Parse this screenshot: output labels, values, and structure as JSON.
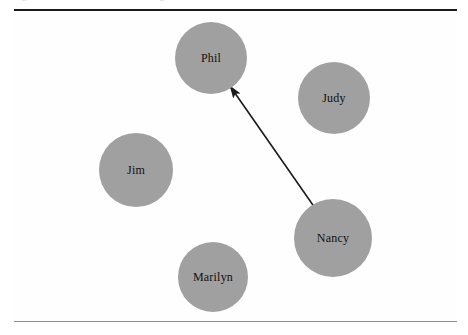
{
  "figure": {
    "type": "sociogram",
    "caption_bleed_left": "g",
    "caption_bleed_right": "g",
    "node_fill_color": "#a0a0a0",
    "node_label_color": "#111111",
    "edge_color": "#1a1a1a",
    "rule_top_color": "#1b1b1b",
    "rule_bottom_color": "#8d8d8d",
    "background_color": "#ffffff"
  },
  "chart_data": {
    "type": "scatter",
    "title": "",
    "xlabel": "",
    "ylabel": "",
    "grid": false,
    "legend": "none",
    "xlim": [
      0,
      468
    ],
    "ylim": [
      0,
      335
    ],
    "nodes": [
      {
        "id": "phil",
        "label": "Phil",
        "x": 211,
        "y": 58,
        "r": 36
      },
      {
        "id": "judy",
        "label": "Judy",
        "x": 334,
        "y": 98,
        "r": 36
      },
      {
        "id": "jim",
        "label": "Jim",
        "x": 136,
        "y": 170,
        "r": 37
      },
      {
        "id": "nancy",
        "label": "Nancy",
        "x": 333,
        "y": 238,
        "r": 39
      },
      {
        "id": "marilyn",
        "label": "Marilyn",
        "x": 213,
        "y": 277,
        "r": 35
      }
    ],
    "edges": [
      {
        "id": "nancy-to-phil",
        "source": "nancy",
        "target": "phil",
        "directed": true,
        "x1": 315,
        "y1": 208,
        "x2": 230,
        "y2": 86
      }
    ]
  }
}
